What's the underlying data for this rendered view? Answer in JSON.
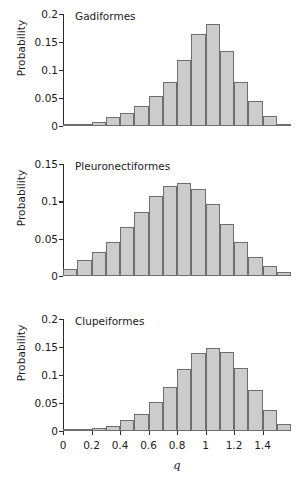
{
  "figure": {
    "width": 303,
    "height": 477,
    "background": "#ffffff",
    "bar_fill": "#cccccc",
    "bar_stroke": "#6e6e6e",
    "axis_color": "#2b2b2b"
  },
  "axis": {
    "xlabel": "q",
    "ylabel": "Probability"
  },
  "chart_data": [
    {
      "type": "bar",
      "title": "Gadiformes",
      "xlabel": "",
      "ylabel": "Probability",
      "xlim": [
        0,
        1.6
      ],
      "ylim": [
        0,
        0.2
      ],
      "bin_width": 0.1,
      "grid": false,
      "legend": "none",
      "yticks": [
        "0",
        "0.05",
        "0.1",
        "0.15",
        "0.2"
      ],
      "ytick_values": [
        0,
        0.05,
        0.1,
        0.15,
        0.2
      ],
      "xticks": [],
      "xtick_values": [],
      "bin_centers": [
        0.05,
        0.15,
        0.25,
        0.35,
        0.45,
        0.55,
        0.65,
        0.75,
        0.85,
        0.95,
        1.05,
        1.15,
        1.25,
        1.35,
        1.45,
        1.55
      ],
      "categories": [
        "0.0-0.1",
        "0.1-0.2",
        "0.2-0.3",
        "0.3-0.4",
        "0.4-0.5",
        "0.5-0.6",
        "0.6-0.7",
        "0.7-0.8",
        "0.8-0.9",
        "0.9-1.0",
        "1.0-1.1",
        "1.1-1.2",
        "1.2-1.3",
        "1.3-1.4",
        "1.4-1.5",
        "1.5-1.6"
      ],
      "values": [
        0.001,
        0.004,
        0.008,
        0.016,
        0.024,
        0.036,
        0.053,
        0.078,
        0.117,
        0.165,
        0.183,
        0.134,
        0.079,
        0.045,
        0.017,
        0.004
      ]
    },
    {
      "type": "bar",
      "title": "Pleuronectiformes",
      "xlabel": "",
      "ylabel": "Probability",
      "xlim": [
        0,
        1.6
      ],
      "ylim": [
        0,
        0.15
      ],
      "bin_width": 0.1,
      "grid": false,
      "legend": "none",
      "yticks": [
        "0",
        "0.05",
        "0.1",
        "0.15"
      ],
      "ytick_values": [
        0,
        0.05,
        0.1,
        0.15
      ],
      "xticks": [],
      "xtick_values": [],
      "bin_centers": [
        0.05,
        0.15,
        0.25,
        0.35,
        0.45,
        0.55,
        0.65,
        0.75,
        0.85,
        0.95,
        1.05,
        1.15,
        1.25,
        1.35,
        1.45,
        1.55
      ],
      "categories": [
        "0.0-0.1",
        "0.1-0.2",
        "0.2-0.3",
        "0.3-0.4",
        "0.4-0.5",
        "0.5-0.6",
        "0.6-0.7",
        "0.7-0.8",
        "0.8-0.9",
        "0.9-1.0",
        "1.0-1.1",
        "1.1-1.2",
        "1.2-1.3",
        "1.3-1.4",
        "1.4-1.5",
        "1.5-1.6"
      ],
      "values": [
        0.01,
        0.022,
        0.032,
        0.046,
        0.065,
        0.086,
        0.107,
        0.12,
        0.124,
        0.117,
        0.097,
        0.069,
        0.046,
        0.026,
        0.013,
        0.005
      ]
    },
    {
      "type": "bar",
      "title": "Clupeiformes",
      "xlabel": "q",
      "ylabel": "Probability",
      "xlim": [
        0,
        1.6
      ],
      "ylim": [
        0,
        0.2
      ],
      "bin_width": 0.1,
      "grid": false,
      "legend": "none",
      "yticks": [
        "0",
        "0.05",
        "0.1",
        "0.15",
        "0.2"
      ],
      "ytick_values": [
        0,
        0.05,
        0.1,
        0.15,
        0.2
      ],
      "xticks": [
        "0",
        "0.2",
        "0.4",
        "0.6",
        "0.8",
        "1",
        "1.2",
        "1.4"
      ],
      "xtick_values": [
        0,
        0.2,
        0.4,
        0.6,
        0.8,
        1.0,
        1.2,
        1.4
      ],
      "bin_centers": [
        0.05,
        0.15,
        0.25,
        0.35,
        0.45,
        0.55,
        0.65,
        0.75,
        0.85,
        0.95,
        1.05,
        1.15,
        1.25,
        1.35,
        1.45,
        1.55
      ],
      "categories": [
        "0.0-0.1",
        "0.1-0.2",
        "0.2-0.3",
        "0.3-0.4",
        "0.4-0.5",
        "0.5-0.6",
        "0.6-0.7",
        "0.7-0.8",
        "0.8-0.9",
        "0.9-1.0",
        "1.0-1.1",
        "1.1-1.2",
        "1.2-1.3",
        "1.3-1.4",
        "1.4-1.5",
        "1.5-1.6"
      ],
      "values": [
        0.001,
        0.002,
        0.005,
        0.009,
        0.02,
        0.03,
        0.051,
        0.078,
        0.11,
        0.139,
        0.149,
        0.141,
        0.112,
        0.074,
        0.038,
        0.012
      ]
    }
  ]
}
